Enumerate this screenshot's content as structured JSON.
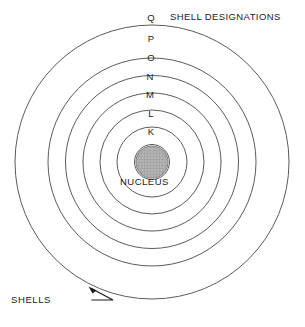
{
  "figure": {
    "type": "diagram",
    "background_color": "#ffffff",
    "line_color": "#5b5b5b",
    "text_color": "#1a1a1a",
    "nucleus_fill": "#b0b0b0"
  },
  "labels": {
    "shell_designations_title": "SHELL DESIGNATIONS",
    "nucleus": "NUCLEUS",
    "shells": "SHELLS"
  },
  "shells": [
    {
      "letter": "K",
      "index": 1,
      "label_x": 145,
      "label_y": 130,
      "radius": 17.5
    },
    {
      "letter": "L",
      "index": 2,
      "label_x": 145,
      "label_y": 112,
      "radius": 35
    },
    {
      "letter": "M",
      "index": 3,
      "label_x": 144,
      "label_y": 93,
      "radius": 52
    },
    {
      "letter": "N",
      "index": 4,
      "label_x": 145,
      "label_y": 75,
      "radius": 69
    },
    {
      "letter": "O",
      "index": 5,
      "label_x": 145,
      "label_y": 56,
      "radius": 86.5
    },
    {
      "letter": "P",
      "index": 6,
      "label_x": 145,
      "label_y": 37,
      "radius": 104
    },
    {
      "letter": "Q",
      "index": 7,
      "label_x": 145,
      "label_y": 15,
      "radius": 137
    }
  ],
  "geometry": {
    "center_x": 152,
    "center_y": 162,
    "ring_radii": [
      17.5,
      35,
      52,
      69,
      86.5,
      104,
      137
    ],
    "nucleus_radius": 16,
    "canvas_width": 305,
    "canvas_height": 327
  },
  "leader": {
    "from_x": 92,
    "from_y": 300,
    "mid_x": 113,
    "mid_y": 300,
    "to_x": 90,
    "to_y": 288
  }
}
